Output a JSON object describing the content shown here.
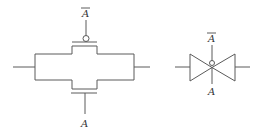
{
  "diagram": {
    "circuit": {
      "gate_top_label": "A",
      "gate_top_inverted": true,
      "gate_bottom_label": "A",
      "gate_bottom_inverted": false
    },
    "symbol": {
      "control_top_label": "A",
      "control_top_inverted": true,
      "control_bottom_label": "A",
      "control_bottom_inverted": false
    },
    "colors": {
      "line": "#5a5a5a",
      "text": "#333333",
      "background": "#ffffff"
    }
  }
}
